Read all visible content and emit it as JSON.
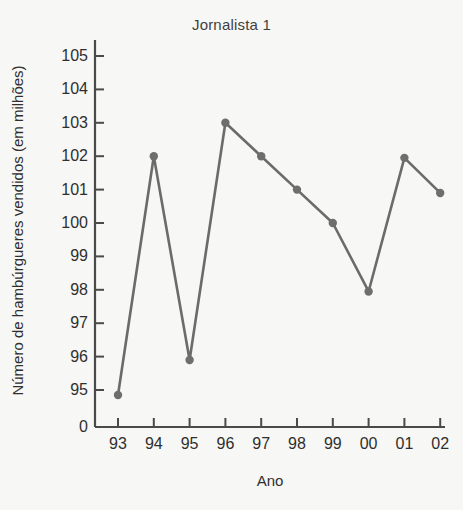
{
  "chart_data": {
    "type": "line",
    "title": "Jornalista 1",
    "xlabel": "Ano",
    "ylabel": "Número de hambúrgueres vendidos (em milhões)",
    "categories": [
      "93",
      "94",
      "95",
      "96",
      "97",
      "98",
      "99",
      "00",
      "01",
      "02"
    ],
    "values": [
      94.85,
      102.0,
      95.9,
      103.0,
      102.0,
      101.0,
      100.0,
      97.95,
      101.95,
      100.9
    ],
    "series": [
      {
        "name": "Jornalista 1",
        "values": [
          94.85,
          102.0,
          95.9,
          103.0,
          102.0,
          101.0,
          100.0,
          97.95,
          101.95,
          100.9
        ]
      }
    ],
    "ytick_labels": [
      "105",
      "104",
      "103",
      "102",
      "101",
      "100",
      "99",
      "98",
      "97",
      "96",
      "95",
      "0"
    ],
    "ytick_values": [
      105,
      104,
      103,
      102,
      101,
      100,
      99,
      98,
      97,
      96,
      95,
      0
    ],
    "ylim": [
      94.0,
      105.6
    ],
    "grid": false,
    "legend": "none",
    "line_color": "#6b6b6b",
    "marker_color": "#6e6e6e",
    "axis_color": "#4a4a4a",
    "background_color": "#f7f7f5",
    "marker": "circle",
    "axis_break": true
  },
  "chart": {
    "title": "Jornalista 1",
    "x_axis_title": "Ano",
    "y_axis_title": "Número de hambúrgueres vendidos (em milhões)"
  }
}
